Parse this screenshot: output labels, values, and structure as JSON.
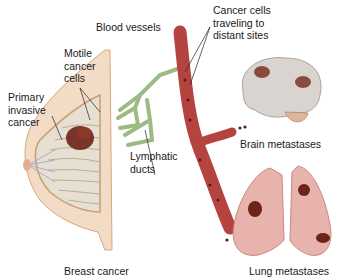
{
  "diagram": {
    "labels": {
      "blood_vessels": "Blood vessels",
      "cancer_cells_line1": "Cancer cells",
      "cancer_cells_line2": "traveling to",
      "cancer_cells_line3": "distant sites",
      "motile_line1": "Motile",
      "motile_line2": "cancer",
      "motile_line3": "cells",
      "primary_line1": "Primary",
      "primary_line2": "invasive",
      "primary_line3": "cancer",
      "lymphatic_line1": "Lymphatic",
      "lymphatic_line2": "ducts",
      "brain": "Brain metastases",
      "lung": "Lung metastases",
      "breast": "Breast cancer"
    },
    "colors": {
      "vessel": "#b5433f",
      "lymph": "#9dba82",
      "tumor": "#6b2418",
      "lung": "#e8b3ad",
      "brain": "#d9d4cf"
    }
  }
}
